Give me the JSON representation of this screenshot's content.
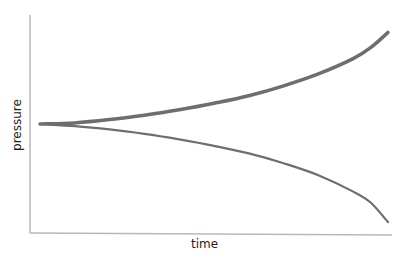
{
  "chart_data": {
    "type": "line",
    "title": "",
    "xlabel": "time",
    "ylabel": "pressure",
    "grid": false,
    "legend": null,
    "axis_ticks": "none",
    "x": [
      0,
      0.1,
      0.2,
      0.3,
      0.4,
      0.5,
      0.6,
      0.7,
      0.8,
      0.9,
      0.95,
      1.0
    ],
    "series": [
      {
        "name": "upper",
        "color": "#6e6e6e",
        "line_width": 3.5,
        "values": [
          0.5,
          0.505,
          0.52,
          0.54,
          0.565,
          0.595,
          0.63,
          0.675,
          0.73,
          0.8,
          0.85,
          0.92
        ]
      },
      {
        "name": "lower",
        "color": "#6e6e6e",
        "line_width": 2.2,
        "values": [
          0.5,
          0.49,
          0.475,
          0.455,
          0.43,
          0.4,
          0.365,
          0.32,
          0.265,
          0.19,
          0.14,
          0.05
        ]
      }
    ],
    "xlim": [
      0,
      1
    ],
    "ylim": [
      0,
      1
    ]
  },
  "labels": {
    "x": "time",
    "y": "pressure"
  }
}
